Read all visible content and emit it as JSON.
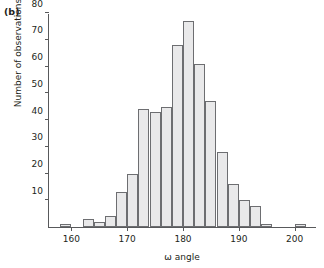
{
  "figure": {
    "panel_label": "(b)"
  },
  "chart_data": {
    "type": "bar",
    "title": "",
    "xlabel": "ω angle",
    "ylabel": "Number of observations",
    "xlim": [
      156,
      204
    ],
    "ylim": [
      0,
      80
    ],
    "xticks": [
      160,
      170,
      180,
      190,
      200
    ],
    "xtick_labels": [
      "160",
      "170",
      "180",
      "190",
      "200"
    ],
    "yticks": [
      10,
      20,
      30,
      40,
      50,
      60,
      70,
      80
    ],
    "ytick_labels": [
      "10",
      "20",
      "30",
      "40",
      "50",
      "60",
      "70",
      "80"
    ],
    "grid": false,
    "legend": null,
    "bin_width": 2,
    "bin_starts": [
      158,
      160,
      162,
      164,
      166,
      168,
      170,
      172,
      174,
      176,
      178,
      180,
      182,
      184,
      186,
      188,
      190,
      192,
      194,
      196,
      198,
      200
    ],
    "categories": [
      "158-160",
      "160-162",
      "162-164",
      "164-166",
      "166-168",
      "168-170",
      "170-172",
      "172-174",
      "174-176",
      "176-178",
      "178-180",
      "180-182",
      "182-184",
      "184-186",
      "186-188",
      "188-190",
      "190-192",
      "192-194",
      "194-196",
      "196-198",
      "198-200",
      "200-202"
    ],
    "values": [
      1,
      0,
      3,
      2,
      4,
      13,
      20,
      44,
      43,
      45,
      68,
      77,
      61,
      47,
      28,
      16,
      10,
      8,
      1,
      0,
      0,
      1
    ],
    "bar_fill_color": "#e9e9ea",
    "bar_edge_color": "#6d6e71",
    "axis_color": "#58595b"
  }
}
